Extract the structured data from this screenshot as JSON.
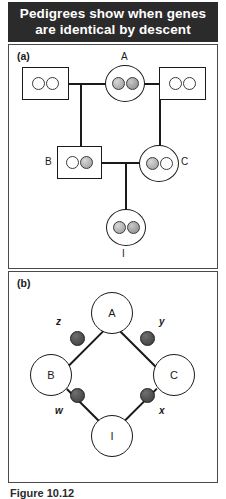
{
  "header": {
    "title_line1": "Pedigrees show when genes",
    "title_line2": "are identical by descent"
  },
  "panel_a": {
    "label": "(a)",
    "individuals": [
      {
        "id": "founder-male-left",
        "shape": "square",
        "label": "",
        "alleles": [
          "white",
          "white"
        ]
      },
      {
        "id": "A",
        "shape": "circle",
        "label": "A",
        "alleles": [
          "grey",
          "grey"
        ]
      },
      {
        "id": "founder-male-right",
        "shape": "square",
        "label": "",
        "alleles": [
          "white",
          "white"
        ]
      },
      {
        "id": "B",
        "shape": "square",
        "label": "B",
        "alleles": [
          "white",
          "grey"
        ]
      },
      {
        "id": "C",
        "shape": "circle",
        "label": "C",
        "alleles": [
          "grey",
          "white"
        ]
      },
      {
        "id": "I",
        "shape": "circle",
        "label": "I",
        "alleles": [
          "grey",
          "grey"
        ]
      }
    ]
  },
  "panel_b": {
    "label": "(b)",
    "nodes": [
      {
        "id": "A",
        "label": "A"
      },
      {
        "id": "B",
        "label": "B"
      },
      {
        "id": "C",
        "label": "C"
      },
      {
        "id": "I",
        "label": "I"
      }
    ],
    "path_labels": {
      "top_left": "z",
      "top_right": "y",
      "bottom_left": "w",
      "bottom_right": "x"
    }
  },
  "caption": {
    "text": "Figure 10.12"
  },
  "colors": {
    "header_background": "#2b2b2b",
    "header_text": "#ffffff",
    "stroke": "#1a1a1a",
    "panel_border": "#4a4a4a",
    "allele_grey": "#b4b4b4",
    "gamete_dot": "#4f4f4f"
  }
}
